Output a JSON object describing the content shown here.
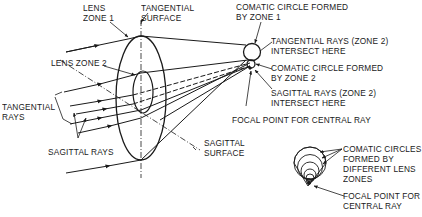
{
  "diagram": {
    "type": "optics-coma-aberration",
    "labels": {
      "lens_zone_1": "LENS\nZONE 1",
      "tangential_surface": "TANGENTIAL\nSURFACE",
      "lens_zone_2": "LENS ZONE 2",
      "tangential_rays": "TANGENTIAL\nRAYS",
      "sagittal_rays": "SAGITTAL RAYS",
      "sagittal_surface": "SAGITTAL\nSURFACE",
      "comatic_circle_zone_1": "COMATIC CIRCLE FORMED\nBY ZONE 1",
      "tangential_rays_zone2": "TANGENTIAL RAYS (ZONE 2)\nINTERSECT HERE",
      "comatic_circle_zone_2": "COMATIC CIRCLE FORMED\nBY ZONE 2",
      "sagittal_rays_zone2": "SAGITTAL RAYS (ZONE 2)\nINTERSECT HERE",
      "focal_point_central": "FOCAL POINT FOR CENTRAL RAY",
      "comatic_circles_diff_zones": "COMATIC CIRCLES\nFORMED BY\nDIFFERENT LENS\nZONES",
      "focal_point_central_2": "FOCAL POINT FOR\nCENTRAL RAY"
    },
    "colors": {
      "line": "#1a1a1a",
      "background": "#ffffff"
    }
  }
}
